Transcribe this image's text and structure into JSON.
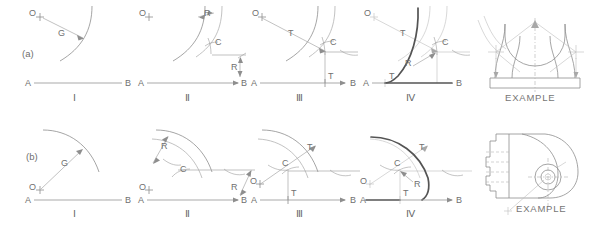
{
  "figure": {
    "rows": [
      {
        "id": "row-a",
        "row_label": "(a)",
        "panels": [
          {
            "step": "Ⅰ",
            "labels": {
              "center": "O",
              "radius_arc": "G",
              "line_start": "A",
              "line_end": "B"
            }
          },
          {
            "step": "Ⅱ",
            "labels": {
              "center": "O",
              "radius_left": "R",
              "radius_right": "R",
              "center_point": "C",
              "line_start": "A",
              "line_end": "B"
            }
          },
          {
            "step": "Ⅲ",
            "labels": {
              "center": "O",
              "tangent_upper": "T",
              "tangent_lower": "T",
              "center_point": "C",
              "line_start": "A",
              "line_end": "B"
            }
          },
          {
            "step": "Ⅳ",
            "labels": {
              "center": "O",
              "tangent_upper": "T",
              "tangent_lower": "T",
              "center_point": "C",
              "radius": "R",
              "line_start": "A",
              "line_end": "B"
            }
          },
          {
            "step": "EXAMPLE",
            "labels": {}
          }
        ]
      },
      {
        "id": "row-b",
        "row_label": "(b)",
        "panels": [
          {
            "step": "Ⅰ",
            "labels": {
              "center": "O",
              "radius_arc": "G",
              "line_start": "A",
              "line_end": "B"
            }
          },
          {
            "step": "Ⅱ",
            "labels": {
              "center": "O",
              "radius_left": "R",
              "radius_right": "R",
              "center_point": "C",
              "line_start": "A",
              "line_end": "B"
            }
          },
          {
            "step": "Ⅲ",
            "labels": {
              "center": "O",
              "tangent_upper": "T",
              "tangent_lower": "T",
              "center_point": "C",
              "line_start": "A",
              "line_end": "B"
            }
          },
          {
            "step": "Ⅳ",
            "labels": {
              "center": "O",
              "tangent_upper": "T",
              "tangent_lower": "T",
              "center_point": "C",
              "radius": "R",
              "line_start": "A",
              "line_end": "B"
            }
          },
          {
            "step": "EXAMPLE",
            "labels": {}
          }
        ]
      }
    ],
    "colors": {
      "background": "#ffffff",
      "line": "#8e8e8e",
      "line_faint": "#bdbdbd",
      "line_bold": "#545454",
      "text": "#6b6b6b"
    }
  }
}
